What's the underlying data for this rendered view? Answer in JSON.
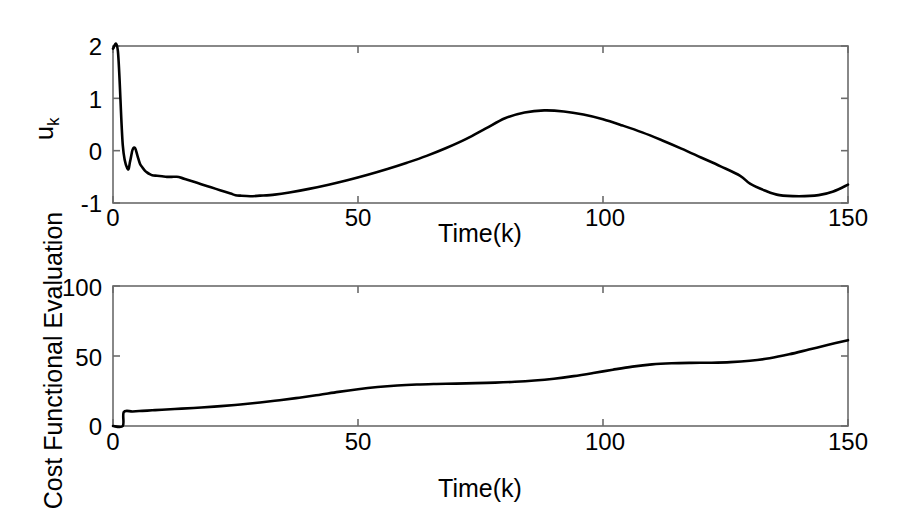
{
  "figure": {
    "background_color": "#ffffff",
    "line_color": "#000000",
    "axis_color": "#6b6b6b"
  },
  "panels": {
    "upper": {
      "ylabel_main": "u",
      "ylabel_sub": "k",
      "xlabel": "Time(k)",
      "ytick_labels": [
        "2",
        "1",
        "0",
        "-1"
      ],
      "xtick_labels": [
        "0",
        "50",
        "100",
        "150"
      ]
    },
    "lower": {
      "ylabel": "Cost Functional Evaluation",
      "xlabel": "Time(k)",
      "ytick_labels": [
        "100",
        "50",
        "0"
      ],
      "xtick_labels": [
        "0",
        "50",
        "100",
        "150"
      ]
    }
  },
  "chart_data": [
    {
      "type": "line",
      "title": "",
      "xlabel": "Time(k)",
      "ylabel": "u_k",
      "xlim": [
        0,
        150
      ],
      "ylim": [
        -1,
        2
      ],
      "xticks": [
        0,
        50,
        100,
        150
      ],
      "yticks": [
        -1,
        0,
        1,
        2
      ],
      "grid": false,
      "legend": null,
      "series": [
        {
          "name": "u_k",
          "color": "#000000",
          "x": [
            0,
            1,
            2,
            3,
            3.5,
            4,
            4.5,
            5,
            5.5,
            6,
            6.5,
            7,
            7.5,
            8,
            9,
            10,
            11,
            12,
            13,
            14,
            15,
            16,
            17,
            18,
            20,
            22,
            24,
            25,
            26,
            28,
            30,
            33,
            36,
            40,
            44,
            48,
            52,
            56,
            60,
            64,
            68,
            72,
            76,
            80,
            84,
            88,
            92,
            96,
            100,
            104,
            108,
            112,
            116,
            120,
            124,
            128,
            130,
            133,
            136,
            140,
            144,
            147,
            150
          ],
          "y": [
            1.95,
            1.9,
            0.1,
            -0.35,
            -0.2,
            0.02,
            0.05,
            -0.1,
            -0.25,
            -0.32,
            -0.38,
            -0.42,
            -0.45,
            -0.47,
            -0.48,
            -0.49,
            -0.5,
            -0.5,
            -0.5,
            -0.52,
            -0.55,
            -0.58,
            -0.61,
            -0.64,
            -0.7,
            -0.76,
            -0.82,
            -0.85,
            -0.86,
            -0.87,
            -0.86,
            -0.84,
            -0.8,
            -0.73,
            -0.65,
            -0.56,
            -0.46,
            -0.35,
            -0.23,
            -0.1,
            0.05,
            0.22,
            0.42,
            0.62,
            0.73,
            0.77,
            0.75,
            0.69,
            0.6,
            0.48,
            0.35,
            0.2,
            0.04,
            -0.13,
            -0.3,
            -0.48,
            -0.63,
            -0.76,
            -0.85,
            -0.87,
            -0.85,
            -0.78,
            -0.65,
            -0.52,
            -0.45
          ]
        }
      ]
    },
    {
      "type": "line",
      "title": "",
      "xlabel": "Time(k)",
      "ylabel": "Cost Functional Evaluation",
      "xlim": [
        0,
        150
      ],
      "ylim": [
        0,
        100
      ],
      "xticks": [
        0,
        50,
        100,
        150
      ],
      "yticks": [
        0,
        50,
        100
      ],
      "grid": false,
      "legend": null,
      "series": [
        {
          "name": "Cost Functional Evaluation",
          "color": "#000000",
          "x": [
            0,
            2,
            2.2,
            4,
            6,
            8,
            10,
            14,
            18,
            22,
            26,
            30,
            34,
            38,
            42,
            46,
            50,
            54,
            58,
            62,
            66,
            70,
            74,
            78,
            82,
            86,
            90,
            94,
            98,
            102,
            106,
            110,
            114,
            118,
            122,
            126,
            130,
            134,
            138,
            142,
            146,
            150
          ],
          "y": [
            0,
            0,
            10.0,
            10.4,
            10.8,
            11.2,
            11.6,
            12.4,
            13.2,
            14.2,
            15.4,
            16.8,
            18.4,
            20.2,
            22.2,
            24.4,
            26.3,
            27.8,
            28.9,
            29.6,
            30.0,
            30.3,
            30.6,
            31.0,
            31.6,
            32.5,
            33.8,
            35.6,
            37.8,
            40.2,
            42.4,
            44.0,
            44.8,
            45.1,
            45.2,
            45.6,
            46.6,
            48.4,
            51.2,
            54.6,
            58.0,
            61.3
          ]
        }
      ]
    }
  ]
}
